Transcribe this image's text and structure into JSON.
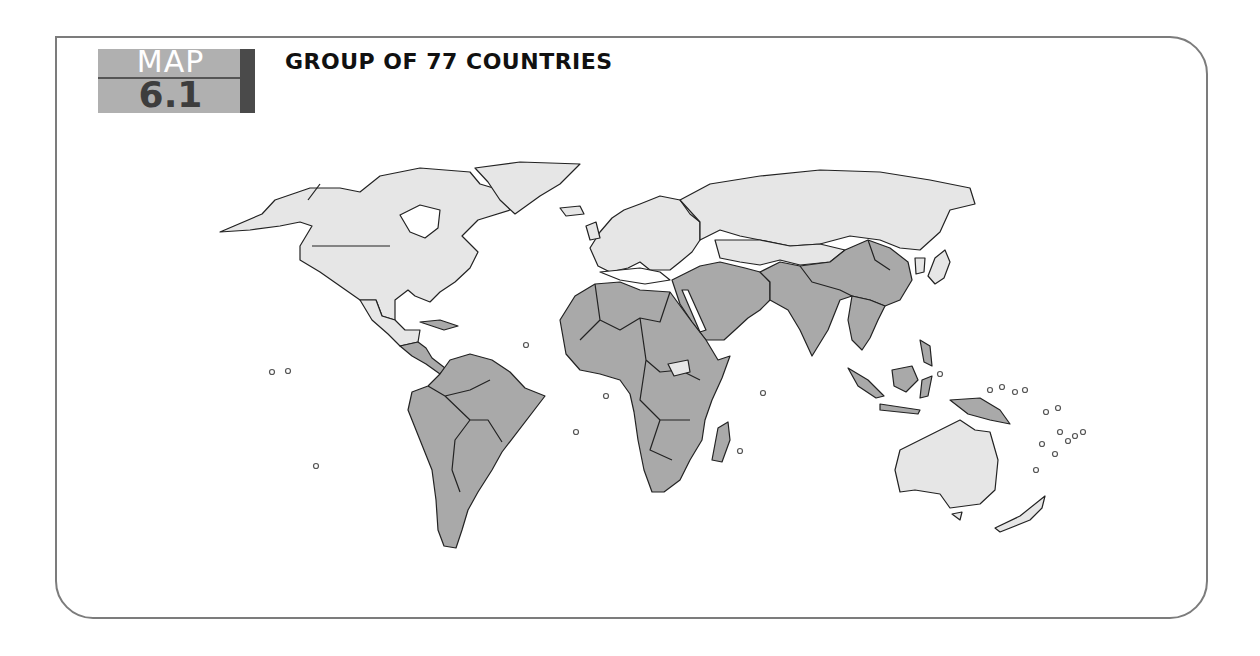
{
  "header": {
    "label": "MAP",
    "number": "6.1",
    "title": "GROUP OF 77 COUNTRIES"
  },
  "map": {
    "projection": "world",
    "legend_colors": {
      "member": "#a9a9a9",
      "non_member": "#e6e6e6",
      "ocean": "#ffffff",
      "border": "#222222"
    },
    "member_regions": [
      "Latin America",
      "Caribbean",
      "Africa",
      "Middle East",
      "South Asia",
      "China",
      "Southeast Asia",
      "Pacific Islands"
    ],
    "non_member_regions": [
      "North America",
      "Greenland",
      "Europe",
      "Russia",
      "Central Asia north",
      "Mongolia",
      "Japan",
      "Korea",
      "Australia",
      "New Zealand",
      "South Sudan"
    ]
  }
}
